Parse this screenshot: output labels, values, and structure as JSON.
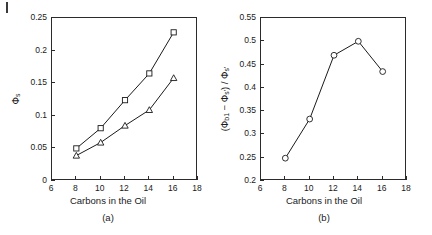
{
  "figure": {
    "page_mark": "page-edge-mark"
  },
  "panels": [
    {
      "id": "a",
      "caption": "(a)",
      "xlabel": "Carbons in the Oil",
      "ylabel_phi": "Φ",
      "ylabel_sub": "s",
      "xticks": [
        "6",
        "8",
        "10",
        "12",
        "14",
        "16",
        "18"
      ],
      "yticks": [
        "0",
        "0.05",
        "0.1",
        "0.15",
        "0.2",
        "0.25"
      ]
    },
    {
      "id": "b",
      "caption": "(b)",
      "xlabel": "Carbons in the Oil",
      "ylabel_open": "(",
      "ylabel_phi1": "Φ",
      "ylabel_sub1": "b1",
      "ylabel_minus": " − ",
      "ylabel_phi2": "Φ",
      "ylabel_sub2": "s'",
      "ylabel_close": ") / ",
      "ylabel_phi3": "Φ",
      "ylabel_sub3": "s'",
      "xticks": [
        "6",
        "8",
        "10",
        "12",
        "14",
        "16",
        "18"
      ],
      "yticks": [
        "0.2",
        "0.25",
        "0.3",
        "0.35",
        "0.4",
        "0.45",
        "0.5",
        "0.55"
      ]
    }
  ],
  "chart_data": [
    {
      "type": "line",
      "panel": "a",
      "title": "",
      "xlabel": "Carbons in the Oil",
      "ylabel": "Φs",
      "xlim": [
        6,
        18
      ],
      "ylim": [
        0,
        0.25
      ],
      "xticks": [
        6,
        8,
        10,
        12,
        14,
        16,
        18
      ],
      "yticks": [
        0,
        0.05,
        0.1,
        0.15,
        0.2,
        0.25
      ],
      "grid": false,
      "legend": "none",
      "x": [
        8,
        10,
        12,
        14,
        16
      ],
      "series": [
        {
          "name": "upper",
          "marker": "square",
          "color": "#1a1a1a",
          "values": [
            0.05,
            0.081,
            0.124,
            0.165,
            0.228
          ]
        },
        {
          "name": "lower",
          "marker": "triangle",
          "color": "#1a1a1a",
          "values": [
            0.039,
            0.059,
            0.085,
            0.109,
            0.158
          ]
        }
      ]
    },
    {
      "type": "line",
      "panel": "b",
      "title": "",
      "xlabel": "Carbons in the Oil",
      "ylabel": "(Φb1 − Φs') / Φs'",
      "xlim": [
        6,
        18
      ],
      "ylim": [
        0.2,
        0.55
      ],
      "xticks": [
        6,
        8,
        10,
        12,
        14,
        16,
        18
      ],
      "yticks": [
        0.2,
        0.25,
        0.3,
        0.35,
        0.4,
        0.45,
        0.5,
        0.55
      ],
      "grid": false,
      "legend": "none",
      "x": [
        8,
        10,
        12,
        14,
        16
      ],
      "series": [
        {
          "name": "ratio",
          "marker": "circle",
          "color": "#1a1a1a",
          "values": [
            0.249,
            0.333,
            0.47,
            0.5,
            0.435
          ]
        }
      ]
    }
  ]
}
